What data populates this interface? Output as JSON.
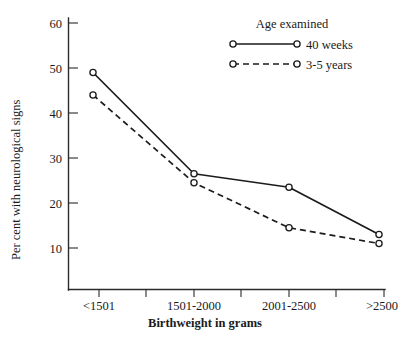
{
  "chart_data": {
    "type": "line",
    "title": "",
    "xlabel": "Birthweight in grams",
    "ylabel": "Per cent with neurological signs",
    "categories": [
      "<1501",
      "1501-2000",
      "2001-2500",
      ">2500"
    ],
    "series": [
      {
        "name": "40 weeks",
        "style": "solid",
        "marker": "open-circle",
        "values": [
          49,
          26.5,
          23.5,
          13
        ]
      },
      {
        "name": "3-5 years",
        "style": "dashed",
        "marker": "open-circle",
        "values": [
          44,
          24.5,
          14.5,
          11
        ]
      }
    ],
    "ylim": [
      0,
      60
    ],
    "yticks": [
      10,
      20,
      30,
      40,
      50,
      60
    ],
    "ytick_labels": [
      "10",
      "20",
      "30",
      "40",
      "50",
      "60"
    ],
    "grid": false,
    "legend_position": "top-right",
    "legend_title": "Age examined",
    "line_color": "#1b1b1b",
    "axis_color": "#2b2b2b",
    "background": "#ffffff"
  },
  "axes": {
    "y_tick_labels": {
      "t60": "60",
      "t50": "50",
      "t40": "40",
      "t30": "30",
      "t20": "20",
      "t10": "10"
    },
    "y_axis_title": "Per cent with neurological signs",
    "x_tick_labels": {
      "c1": "<1501",
      "c2": "1501-2000",
      "c3": "2001-2500",
      "c4": ">2500"
    },
    "x_axis_title": "Birthweight in grams"
  },
  "legend": {
    "title": "Age examined",
    "entries": {
      "e1": "40 weeks",
      "e2": "3-5 years"
    }
  }
}
